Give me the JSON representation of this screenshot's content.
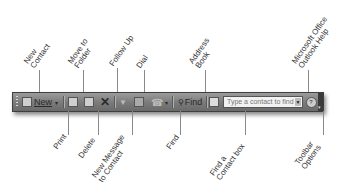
{
  "toolbar": {
    "new_label": "New",
    "find_label": "Find",
    "find_contact_placeholder": "Type a contact to find",
    "icons": {
      "new": "new-contact-icon",
      "print": "print-icon",
      "move": "move-to-folder-icon",
      "delete": "delete-x-icon",
      "follow_up": "flag-icon",
      "new_message": "new-message-icon",
      "dial": "phone-icon",
      "find": "find-icon",
      "address_book": "address-book-icon",
      "help": "help-icon",
      "options": "toolbar-options-icon"
    }
  },
  "callouts": {
    "top": [
      {
        "lines": [
          "New",
          "Contact"
        ]
      },
      {
        "lines": [
          "Move to",
          "Folder"
        ]
      },
      {
        "lines": [
          "Follow Up"
        ]
      },
      {
        "lines": [
          "Dial"
        ]
      },
      {
        "lines": [
          "Address",
          "Book"
        ]
      },
      {
        "lines": [
          "Microsoft Office",
          "Outlook Help"
        ]
      }
    ],
    "bottom": [
      {
        "lines": [
          "Print"
        ]
      },
      {
        "lines": [
          "Delete"
        ]
      },
      {
        "lines": [
          "New Message",
          "to Contact"
        ]
      },
      {
        "lines": [
          "Find"
        ]
      },
      {
        "lines": [
          "Find a",
          "Contact box"
        ]
      },
      {
        "lines": [
          "Toolbar",
          "Options"
        ]
      }
    ]
  }
}
